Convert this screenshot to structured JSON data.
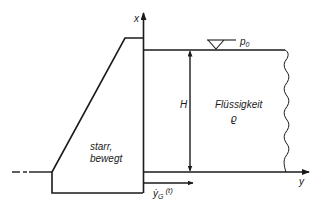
{
  "diagram": {
    "axis_x_label": "x",
    "axis_y_label": "y",
    "pressure_label": "p",
    "pressure_sub": "0",
    "height_label": "H",
    "fluid_label": "Flüssigkeit",
    "density_label": "ϱ",
    "body_label_line1": "starr,",
    "body_label_line2": "bewegt",
    "velocity_label": "ẏ",
    "velocity_sub": "G",
    "velocity_arg": "(t)",
    "stroke_color": "#1a1a1a",
    "background": "#ffffff"
  }
}
